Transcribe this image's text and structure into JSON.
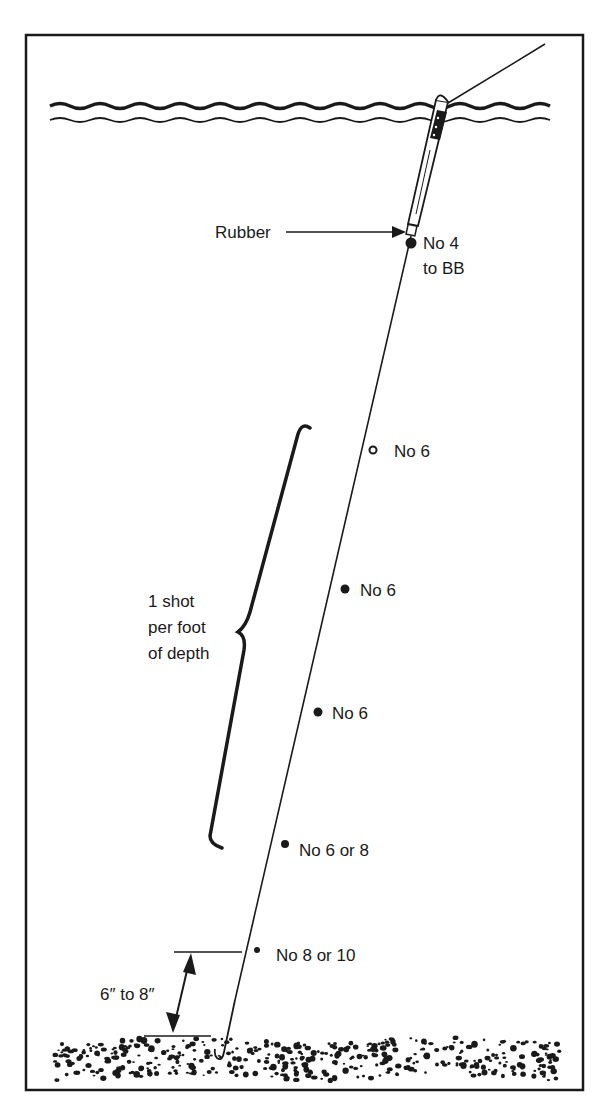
{
  "diagram": {
    "type": "fishing-float-shotting-pattern",
    "colors": {
      "ink": "#1a1a1a",
      "background": "#ffffff"
    },
    "labels": {
      "rubber": "Rubber",
      "shot1_line1": "No 4",
      "shot1_line2": "to BB",
      "shot2": "No 6",
      "shot3": "No 6",
      "shot4": "No 6",
      "shot5": "No 6 or 8",
      "shot6": "No 8 or 10",
      "brace_line1": "1 shot",
      "brace_line2": "per foot",
      "brace_line3": "of depth",
      "dimension": "6″ to 8″"
    },
    "shots": [
      {
        "label": "No 4 to BB",
        "x": 411,
        "y": 243,
        "r": 5.5
      },
      {
        "label": "No 6",
        "x": 373,
        "y": 450,
        "r": 3.5,
        "open": true
      },
      {
        "label": "No 6",
        "x": 345,
        "y": 589,
        "r": 4.5
      },
      {
        "label": "No 6",
        "x": 318,
        "y": 712,
        "r": 4.5
      },
      {
        "label": "No 6 or 8",
        "x": 285,
        "y": 844,
        "r": 4
      },
      {
        "label": "No 8 or 10",
        "x": 257,
        "y": 950,
        "r": 3
      }
    ]
  }
}
